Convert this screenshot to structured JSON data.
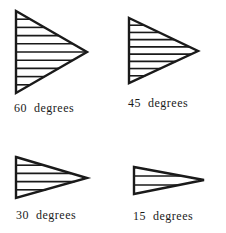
{
  "figure": {
    "background": "#ffffff",
    "stroke_color": "#1a1a1a",
    "panels": [
      {
        "label": "60 degrees",
        "angle_deg": 60,
        "left_x": 16,
        "top_y": 11,
        "bottom_y": 93,
        "tip_x": 87,
        "tip_y": 52,
        "stripes": 9,
        "label_x": 14,
        "label_y": 112
      },
      {
        "label": "45 degrees",
        "angle_deg": 45,
        "left_x": 129,
        "top_y": 18,
        "bottom_y": 83,
        "tip_x": 198,
        "tip_y": 51,
        "stripes": 8,
        "label_x": 128,
        "label_y": 107
      },
      {
        "label": "30 degrees",
        "angle_deg": 30,
        "left_x": 16,
        "top_y": 157,
        "bottom_y": 198,
        "tip_x": 87,
        "tip_y": 178,
        "stripes": 4,
        "label_x": 16,
        "label_y": 219
      },
      {
        "label": "15 degrees",
        "angle_deg": 15,
        "left_x": 134,
        "top_y": 167,
        "bottom_y": 194,
        "tip_x": 204,
        "tip_y": 180,
        "stripes": 2,
        "label_x": 133,
        "label_y": 220
      }
    ]
  }
}
